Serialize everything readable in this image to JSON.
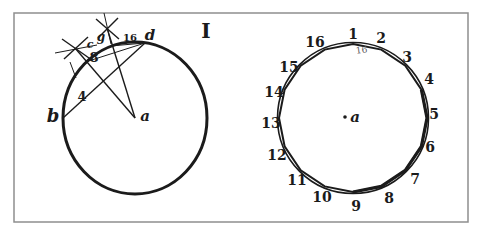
{
  "plate": {
    "figure_numeral": "I",
    "colors": {
      "ink": "#1b1b1b",
      "paper": "#ffffff",
      "frame_border": "#8e8e8e",
      "faint_ink": "#5a5a5a"
    }
  },
  "left_diagram": {
    "description_labels": {
      "center": "a",
      "point_b": "b",
      "point_c": "c",
      "point_g": "g",
      "point_d": "d",
      "square_side": "4",
      "octagon_side": "8",
      "hexadecagon_side": "16"
    }
  },
  "right_diagram": {
    "center": "a",
    "inner_side_label": "16",
    "vertex_labels": [
      "1",
      "2",
      "3",
      "4",
      "5",
      "6",
      "7",
      "8",
      "9",
      "10",
      "11",
      "12",
      "13",
      "14",
      "15",
      "16"
    ]
  }
}
